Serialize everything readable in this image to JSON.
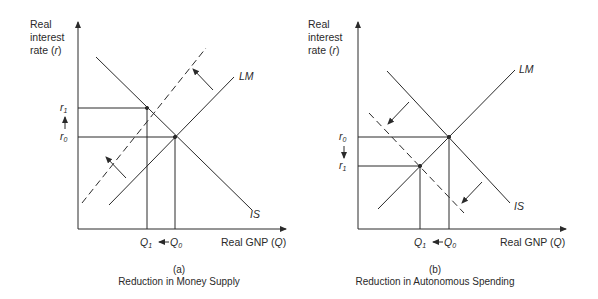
{
  "panel_a": {
    "y_axis_label": [
      "Real",
      "interest",
      "rate (r)"
    ],
    "x_axis_label": "Real GNP (Q)",
    "curve_labels": {
      "lm": "LM",
      "is": "IS"
    },
    "y_ticks": {
      "upper": "r1",
      "lower": "r0",
      "shift": "up"
    },
    "x_ticks": {
      "left": "Q1",
      "right": "Q0",
      "shift": "left"
    },
    "caption_letter": "(a)",
    "caption_title": "Reduction in Money Supply",
    "shifted_curve": "LM (dashed, shifted up-left)"
  },
  "panel_b": {
    "y_axis_label": [
      "Real",
      "interest",
      "rate (r)"
    ],
    "x_axis_label": "Real GNP (Q)",
    "curve_labels": {
      "lm": "LM",
      "is": "IS"
    },
    "y_ticks": {
      "upper": "r0",
      "lower": "r1",
      "shift": "down"
    },
    "x_ticks": {
      "left": "Q1",
      "right": "Q0",
      "shift": "left"
    },
    "caption_letter": "(b)",
    "caption_title": "Reduction in Autonomous Spending",
    "shifted_curve": "IS (dashed, shifted down-left)"
  },
  "labels": {
    "real": "Real",
    "interest": "interest",
    "rate": "rate (",
    "r": "r",
    "close": ")",
    "gnp": "Real GNP (",
    "Q": "Q",
    "LM": "LM",
    "IS": "IS",
    "r_sym": "r",
    "q_sym": "Q",
    "sub0": "0",
    "sub1": "1",
    "cap_a_letter": "(a)",
    "cap_a_title": "Reduction in Money Supply",
    "cap_b_letter": "(b)",
    "cap_b_title": "Reduction in Autonomous Spending"
  },
  "colors": {
    "line": "#2a2a2a",
    "background": "#ffffff"
  }
}
